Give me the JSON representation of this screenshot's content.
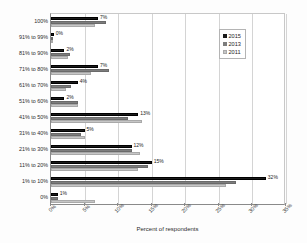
{
  "chart_data": {
    "type": "bar",
    "orientation": "horizontal",
    "title": "",
    "xlabel": "Percent of respondents",
    "ylabel": "",
    "xlim": [
      0,
      35
    ],
    "xticks": [
      "0%",
      "5%",
      "10%",
      "15%",
      "20%",
      "25%",
      "30%",
      "35%"
    ],
    "xtick_values": [
      0,
      5,
      10,
      15,
      20,
      25,
      30,
      35
    ],
    "grid": true,
    "grid_axis": "x",
    "legend_position": "top-right",
    "categories": [
      "100%",
      "91% to 99%",
      "81% to 90%",
      "71% to 80%",
      "61% to 70%",
      "51% to 60%",
      "41% to 50%",
      "31% to 40%",
      "21% to 30%",
      "11% to 20%",
      "1% to 10%",
      "0%"
    ],
    "series": [
      {
        "name": "2015",
        "color": "#1a1a1a",
        "values": [
          7,
          0.4,
          2,
          7,
          4,
          2,
          13,
          5,
          12,
          15,
          32,
          1
        ],
        "labels": [
          "7%",
          "0%",
          "2%",
          "7%",
          "4%",
          "2%",
          "13%",
          "5%",
          "12%",
          "15%",
          "32%",
          "1%"
        ]
      },
      {
        "name": "2013",
        "color": "#7d7d7d",
        "values": [
          8.2,
          0.3,
          2.8,
          8.7,
          3.0,
          4.0,
          11.5,
          4.5,
          12.0,
          14.5,
          27.5,
          1.0
        ],
        "labels": [
          "",
          "",
          "",
          "",
          "",
          "",
          "",
          "",
          "",
          "",
          "",
          ""
        ]
      },
      {
        "name": "2011",
        "color": "#c6c6c6",
        "values": [
          6.6,
          0.3,
          2.5,
          5.9,
          2.2,
          4.0,
          13.6,
          5.0,
          13.2,
          13.0,
          26.0,
          6.6
        ],
        "labels": [
          "",
          "",
          "",
          "",
          "",
          "",
          "",
          "",
          "",
          "",
          "",
          ""
        ]
      }
    ]
  },
  "legend": {
    "entries": [
      "2015",
      "2013",
      "2011"
    ]
  },
  "axis": {
    "x_title": "Percent of respondents"
  }
}
